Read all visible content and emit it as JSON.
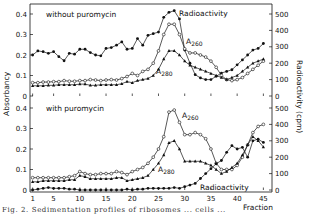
{
  "chart_data": [
    {
      "type": "line",
      "panel": "top",
      "title": "without puromycin",
      "xlabel": "Fraction",
      "ylabel": "Absorbancy",
      "y2label": "Radioactivity (cpm)",
      "ylim": [
        0,
        0.4
      ],
      "y2lim": [
        0,
        500
      ],
      "yticks": [
        "0",
        "0.1",
        "0.2",
        "0.3",
        "0.4"
      ],
      "y2ticks": [
        "0",
        "100",
        "200",
        "300",
        "400",
        "500"
      ],
      "xlim": [
        1,
        46
      ],
      "x": [
        1,
        2,
        3,
        4,
        5,
        6,
        7,
        8,
        9,
        10,
        11,
        12,
        13,
        14,
        15,
        16,
        17,
        18,
        19,
        20,
        21,
        22,
        23,
        24,
        25,
        26,
        27,
        28,
        29,
        30,
        31,
        32,
        33,
        34,
        35,
        36,
        37,
        38,
        39,
        40,
        41,
        42,
        43,
        44,
        45
      ],
      "series": [
        {
          "name": "Radioactivity",
          "axis": "right",
          "marker": "filled-circle",
          "values": [
            250,
            275,
            270,
            260,
            270,
            240,
            215,
            260,
            255,
            285,
            285,
            265,
            250,
            245,
            290,
            295,
            310,
            330,
            285,
            290,
            350,
            310,
            370,
            380,
            390,
            480,
            510,
            520,
            470,
            280,
            200,
            130,
            110,
            100,
            100,
            120,
            140,
            150,
            160,
            190,
            220,
            250,
            280,
            290,
            320,
            230,
            280
          ]
        },
        {
          "name": "A260",
          "axis": "left",
          "marker": "open-circle",
          "values": [
            0.065,
            0.065,
            0.068,
            0.068,
            0.07,
            0.07,
            0.075,
            0.072,
            0.072,
            0.075,
            0.075,
            0.08,
            0.078,
            0.075,
            0.078,
            0.08,
            0.078,
            0.085,
            0.095,
            0.11,
            0.1,
            0.12,
            0.13,
            0.16,
            0.22,
            0.3,
            0.35,
            0.35,
            0.3,
            0.23,
            0.21,
            0.21,
            0.2,
            0.19,
            0.17,
            0.14,
            0.1,
            0.08,
            0.075,
            0.08,
            0.09,
            0.11,
            0.13,
            0.15,
            0.17
          ]
        },
        {
          "name": "A280",
          "axis": "left",
          "marker": "filled-triangle",
          "values": [
            0.05,
            0.05,
            0.05,
            0.052,
            0.052,
            0.055,
            0.055,
            0.055,
            0.055,
            0.058,
            0.058,
            0.052,
            0.052,
            0.055,
            0.055,
            0.055,
            0.055,
            0.06,
            0.07,
            0.065,
            0.075,
            0.08,
            0.085,
            0.1,
            0.13,
            0.18,
            0.22,
            0.22,
            0.2,
            0.17,
            0.15,
            0.14,
            0.13,
            0.12,
            0.11,
            0.1,
            0.09,
            0.08,
            0.09,
            0.1,
            0.12,
            0.14,
            0.16,
            0.17,
            0.18
          ]
        }
      ],
      "annotations": [
        "Radioactivity",
        "A260",
        "A280"
      ]
    },
    {
      "type": "line",
      "panel": "bottom",
      "title": "with puromycin",
      "xlabel": "Fraction",
      "ylabel": "Absorbancy",
      "y2label": "Radioactivity (cpm)",
      "ylim": [
        0,
        0.4
      ],
      "y2lim": [
        0,
        500
      ],
      "yticks": [
        "0",
        "0.1",
        "0.2",
        "0.3",
        "0.4"
      ],
      "y2ticks": [
        "0",
        "100",
        "200",
        "300",
        "400",
        "500"
      ],
      "xticks": [
        "1",
        "5",
        "10",
        "15",
        "20",
        "25",
        "30",
        "35",
        "40",
        "45"
      ],
      "xlim": [
        1,
        46
      ],
      "x": [
        1,
        2,
        3,
        4,
        5,
        6,
        7,
        8,
        9,
        10,
        11,
        12,
        13,
        14,
        15,
        16,
        17,
        18,
        19,
        20,
        21,
        22,
        23,
        24,
        25,
        26,
        27,
        28,
        29,
        30,
        31,
        32,
        33,
        34,
        35,
        36,
        37,
        38,
        39,
        40,
        41,
        42,
        43,
        44,
        45
      ],
      "series": [
        {
          "name": "A260",
          "axis": "left",
          "marker": "open-circle",
          "values": [
            0.06,
            0.06,
            0.06,
            0.06,
            0.06,
            0.06,
            0.06,
            0.065,
            0.07,
            0.09,
            0.08,
            0.075,
            0.075,
            0.08,
            0.08,
            0.08,
            0.09,
            0.085,
            0.075,
            0.09,
            0.1,
            0.11,
            0.13,
            0.16,
            0.2,
            0.26,
            0.38,
            0.39,
            0.33,
            0.27,
            0.27,
            0.28,
            0.27,
            0.25,
            0.2,
            0.13,
            0.1,
            0.1,
            0.1,
            0.12,
            0.16,
            0.22,
            0.28,
            0.31,
            0.32
          ]
        },
        {
          "name": "A280",
          "axis": "left",
          "marker": "filled-triangle",
          "values": [
            0.04,
            0.04,
            0.045,
            0.045,
            0.045,
            0.045,
            0.045,
            0.05,
            0.05,
            0.07,
            0.065,
            0.055,
            0.055,
            0.055,
            0.055,
            0.055,
            0.06,
            0.06,
            0.045,
            0.05,
            0.055,
            0.06,
            0.07,
            0.1,
            0.13,
            0.17,
            0.23,
            0.24,
            0.2,
            0.14,
            0.14,
            0.14,
            0.14,
            0.13,
            0.12,
            0.1,
            0.08,
            0.09,
            0.11,
            0.13,
            0.17,
            0.22,
            0.26,
            0.24,
            0.21
          ]
        },
        {
          "name": "Radioactivity",
          "axis": "right",
          "marker": "filled-circle",
          "values": [
            0,
            5,
            10,
            15,
            10,
            10,
            10,
            5,
            5,
            0,
            0,
            0,
            0,
            0,
            0,
            0,
            0,
            0,
            5,
            0,
            5,
            5,
            10,
            10,
            10,
            10,
            10,
            15,
            10,
            20,
            30,
            40,
            70,
            100,
            130,
            160,
            180,
            230,
            270,
            250,
            260,
            200,
            300,
            310,
            290
          ]
        }
      ],
      "annotations": [
        "A260",
        "A280",
        "Radioactivity"
      ]
    }
  ],
  "labels": {
    "top_title": "without puromycin",
    "bottom_title": "with puromycin",
    "radioactivity": "Radioactivity",
    "a260_main": "A",
    "a260_sub": "260",
    "a280_main": "A",
    "a280_sub": "280",
    "fraction": "Fraction",
    "ylabel_left": "Absorbancy",
    "ylabel_right": "Radioactivity (cpm)",
    "caption": "Fig. 2. Sedimentation profiles of ribosomes ... cells ..."
  },
  "axes": {
    "left_ticks": [
      "0",
      "0.1",
      "0.2",
      "0.3",
      "0.4"
    ],
    "right_ticks": [
      "0",
      "100",
      "200",
      "300",
      "400",
      "500"
    ],
    "x_ticks": [
      "1",
      "5",
      "10",
      "15",
      "20",
      "25",
      "30",
      "35",
      "40",
      "45"
    ]
  }
}
